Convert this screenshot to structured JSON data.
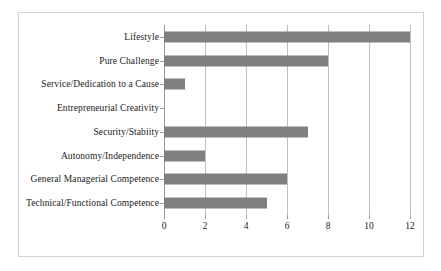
{
  "chart_data": {
    "type": "bar",
    "orientation": "horizontal",
    "title": "",
    "xlabel": "",
    "ylabel": "",
    "categories": [
      "Lifestyle",
      "Pure Challenge",
      "Service/Dedication to a Cause",
      "Entrepreneurial Creativity",
      "Security/Stabiity",
      "Autonomy/Independence",
      "General Managerial Competence",
      "Technical/Functional Competence"
    ],
    "values": [
      12,
      8,
      1,
      0,
      7,
      2,
      6,
      5
    ],
    "xlim": [
      0,
      12
    ],
    "xticks": [
      0,
      2,
      4,
      6,
      8,
      10,
      12
    ],
    "xtick_labels": [
      "0",
      "2",
      "4",
      "6",
      "8",
      "10",
      "12"
    ],
    "grid": "vertical",
    "legend": "none",
    "bar_color": "#808080",
    "gridline_color": "#bfbfbf",
    "axis_color": "#9a9a9a",
    "border_color": "#d3d3d3",
    "background_color": "#ffffff"
  }
}
